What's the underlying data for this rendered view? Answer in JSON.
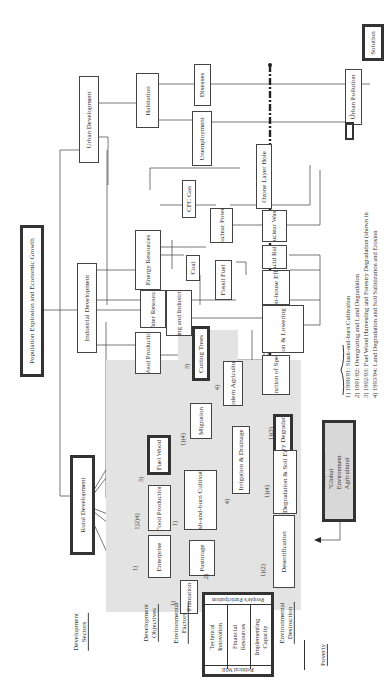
{
  "diagram": {
    "orientation": "rotated-90-ccw",
    "top_node": "Population Explosion and Economic Growth",
    "solution": "Solution",
    "sectors": {
      "development_sectors": "Development Sectors",
      "development_objectives": "Development Objectives",
      "environmental_factors": "Environmental Factors",
      "environmental_destruction": "Environmental Destruction",
      "poverty": "Poverty"
    },
    "development": {
      "rural": "Rural Development",
      "industrial": "Industrial Development",
      "urban": "Urban Development"
    },
    "objectives": {
      "enterprise": "Enterprise",
      "food_production": "Food Production",
      "fuel_wood": "Fuel Wood",
      "wood_production": "Wood Production",
      "water_resources": "Water Resources",
      "energy_resources": "Energy Resources",
      "habitation": "Habitation"
    },
    "factors": {
      "plantation": "Plantation",
      "pasturage": "Pasturage",
      "slash_burn": "Slash-and-burn Cultivation",
      "irrigation": "Irrigation & Drainage",
      "migration": "Migration",
      "modern_agri": "Modern Agriculture",
      "cutting_trees": "Cutting Trees",
      "drinking": "Drinking and Industrial Use",
      "coal": "Coal",
      "fossil_fuel": "Fossil Fuel",
      "nuclear_power": "Nuclear Power",
      "cfc_gas": "CFC Gas",
      "unemployment": "Unemployment",
      "diseases": "Diseases"
    },
    "destruction": {
      "desertification": "Desertification",
      "land_degradation": "Land Degradation & Soil Erosion",
      "forestry_degradation": "Forestry Degradation",
      "extinction": "Extinction of Species",
      "water_pollution": "Water Pollution & Lowering Groundwater",
      "greenhouse": "Green-house Effects",
      "acid_rain": "Acid Rain",
      "nuclear_waste": "Nuclear Waste",
      "ozone": "Ozone Layer Hole",
      "urban_pollution": "Urban Pollution"
    },
    "numbers": {
      "enterprise": "1)",
      "food_production": "1)2)4)",
      "fuel_wood": "3)",
      "slash_burn": "1)",
      "pasturage": "2)",
      "plantation": "1)",
      "irrigation": "4)",
      "migration": "1)(4)",
      "modern_agri": "4)",
      "cutting_trees": "3)",
      "desertification": "1)(2)",
      "land_degradation": "1)(4)",
      "forestry_degradation": "1)(3)"
    },
    "left_table": {
      "political_will": "Political Will",
      "peoples_participation": "People's Participation",
      "technical": "Technical Innovation",
      "financial": "Financial Resources",
      "implementing": "Implementing Capacity"
    },
    "scope": "Scope of the Study entitled \"Global Environment Agricultural Resource Management\"",
    "legend": [
      "1) 1990/91:  Slash-and-burn Cultivation",
      "2) 1991/92:  Overgrazing and Land Degradation",
      "3) 1992/93:  Fuel Wood Harvesting and Forestry Degradation (shown in",
      "4) 1993/94:  Land Degradation and Soil Salinization and Erosion"
    ],
    "legend_suffix": ")"
  }
}
